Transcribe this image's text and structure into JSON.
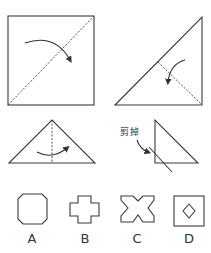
{
  "steps": [
    {
      "id": 1,
      "shape": "square",
      "fold": "diagonal"
    },
    {
      "id": 2,
      "shape": "right-triangle",
      "fold": "toward-right-angle"
    },
    {
      "id": 3,
      "shape": "isosceles-triangle",
      "fold": "vertical-center"
    },
    {
      "id": 4,
      "shape": "small-right-triangle",
      "annotation": "剪掉"
    }
  ],
  "options": [
    {
      "label": "A",
      "shape": "octagon"
    },
    {
      "label": "B",
      "shape": "cross"
    },
    {
      "label": "C",
      "shape": "notched-x"
    },
    {
      "label": "D",
      "shape": "square-with-diamond-hole"
    }
  ],
  "colors": {
    "stroke": "#3a3a3a",
    "background": "#ffffff"
  }
}
